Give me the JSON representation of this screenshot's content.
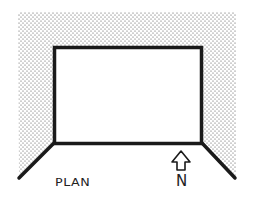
{
  "diagram": {
    "type": "architectural plan",
    "labels": {
      "plan": "PLAN",
      "north": "N"
    },
    "colors": {
      "ink": "#1a1a1a",
      "background": "#ffffff",
      "stipple": "#555555"
    },
    "elements": [
      "stippled enclosing walls",
      "rectangular room outline",
      "splayed diagonal side walls",
      "north arrow"
    ]
  }
}
